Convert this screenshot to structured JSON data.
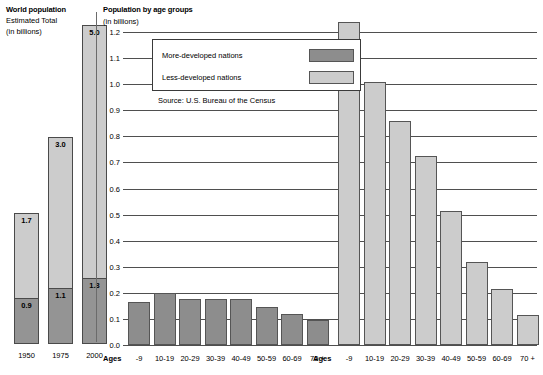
{
  "left_panel": {
    "title": "World population",
    "subtitle1": "Estimated Total",
    "subtitle2": "(in billions)"
  },
  "right_panel": {
    "title": "Population by age groups",
    "subtitle": "(in billions)"
  },
  "legend": {
    "items": [
      {
        "label": "More-developed nations",
        "color": "#8d8d8d"
      },
      {
        "label": "Less-developed nations",
        "color": "#cccccc"
      }
    ]
  },
  "source": "Source: U.S. Bureau of the Census",
  "chart_data": [
    {
      "type": "bar",
      "id": "world-population-total",
      "title": "World population",
      "subtitle": "Estimated Total (in billions)",
      "stacked": true,
      "categories": [
        "1950",
        "1975",
        "2000"
      ],
      "series": [
        {
          "name": "More-developed nations",
          "color": "#949494",
          "values": [
            0.9,
            1.1,
            1.3
          ]
        },
        {
          "name": "Less-developed nations",
          "color": "#cccccc",
          "values": [
            1.7,
            3.0,
            5.0
          ]
        }
      ],
      "data_labels": {
        "1950": {
          "more": "0.9",
          "less": "1.7"
        },
        "1975": {
          "more": "1.1",
          "less": "3.0"
        },
        "2000": {
          "more": "1.3",
          "less": "5.0"
        }
      },
      "ylim": [
        0,
        6.3
      ],
      "xlabel": "",
      "ylabel": "",
      "grid": false
    },
    {
      "type": "bar",
      "id": "population-by-age-groups",
      "title": "Population by age groups",
      "ylabel": "(in billions)",
      "xlabel": "Ages",
      "ylim": [
        0.0,
        1.2
      ],
      "yticks": [
        "0.0",
        "0.1",
        "0.2",
        "0.3",
        "0.4",
        "0.5",
        "0.6",
        "0.7",
        "0.8",
        "0.9",
        "1.0",
        "1.1",
        "1.2"
      ],
      "grid": true,
      "legend_position": "upper-left",
      "categories": [
        "-9",
        "10-19",
        "20-29",
        "30-39",
        "40-49",
        "50-59",
        "60-69",
        "70 +"
      ],
      "series": [
        {
          "name": "More-developed nations",
          "color": "#8d8d8d",
          "values": [
            0.165,
            0.2,
            0.175,
            0.175,
            0.175,
            0.145,
            0.12,
            0.095
          ]
        },
        {
          "name": "Less-developed nations",
          "color": "#cccccc",
          "values": [
            1.24,
            1.01,
            0.86,
            0.725,
            0.515,
            0.32,
            0.215,
            0.115
          ]
        }
      ]
    }
  ],
  "axis": {
    "ages_label": "Ages",
    "yticks": [
      {
        "label": "1.2",
        "value": 1.2
      },
      {
        "label": "1.1",
        "value": 1.1
      },
      {
        "label": "1.0",
        "value": 1.0
      },
      {
        "label": "0.9",
        "value": 0.9
      },
      {
        "label": "0.8",
        "value": 0.8
      },
      {
        "label": "0.7",
        "value": 0.7
      },
      {
        "label": "0.6",
        "value": 0.6
      },
      {
        "label": "0.5",
        "value": 0.5
      },
      {
        "label": "0.4",
        "value": 0.4
      },
      {
        "label": "0.3",
        "value": 0.3
      },
      {
        "label": "0.2",
        "value": 0.2
      },
      {
        "label": "0.1",
        "value": 0.1
      },
      {
        "label": "0.0",
        "value": 0.0
      }
    ]
  }
}
